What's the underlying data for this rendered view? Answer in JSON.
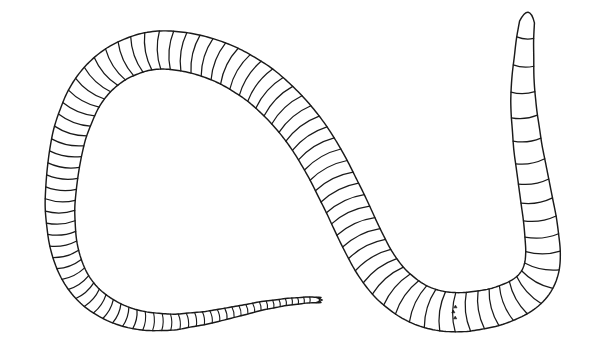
{
  "figure": {
    "title": "Segmented worm line drawing",
    "caption": "",
    "background_color": "#ffffff",
    "line_color": "#1a1a1a",
    "fill_color": "#ffffff",
    "canvas": {
      "width": 593,
      "height": 364
    }
  },
  "chart_data": {
    "type": "diagram",
    "title": "Segmented worm line drawing",
    "parts": [
      {
        "name": "head",
        "label": "anterior tip",
        "position": "upper-right",
        "x": 521,
        "y": 16,
        "width_px": 16,
        "note": "narrow rounded prostomium"
      },
      {
        "name": "clitellum-setae",
        "label": "setae marks",
        "position": "right",
        "x": 538,
        "y": 240,
        "count": 3,
        "note": "three small dark marks inside one segment"
      },
      {
        "name": "tail",
        "label": "posterior tip",
        "position": "lower-centre",
        "x": 322,
        "y": 300,
        "width_px": 5,
        "note": "notched forked terminus"
      }
    ],
    "segment_count_body": 96,
    "segment_count_tail": 34,
    "body_width_min_px": 14,
    "body_width_max_px": 34,
    "xlim": [
      0,
      593
    ],
    "ylim": [
      0,
      364
    ],
    "grid": false,
    "legend": null
  },
  "geometry": {
    "centerline": [
      [
        527,
        22
      ],
      [
        525,
        40
      ],
      [
        524,
        58
      ],
      [
        523,
        76
      ],
      [
        523,
        94
      ],
      [
        524,
        112
      ],
      [
        526,
        130
      ],
      [
        528,
        148
      ],
      [
        531,
        166
      ],
      [
        534,
        184
      ],
      [
        537,
        202
      ],
      [
        540,
        220
      ],
      [
        542,
        238
      ],
      [
        543,
        252
      ],
      [
        542,
        266
      ],
      [
        538,
        278
      ],
      [
        531,
        288
      ],
      [
        521,
        296
      ],
      [
        509,
        302
      ],
      [
        495,
        307
      ],
      [
        480,
        310
      ],
      [
        465,
        312
      ],
      [
        450,
        312
      ],
      [
        436,
        310
      ],
      [
        423,
        306
      ],
      [
        411,
        300
      ],
      [
        400,
        292
      ],
      [
        390,
        283
      ],
      [
        381,
        272
      ],
      [
        373,
        260
      ],
      [
        366,
        247
      ],
      [
        359,
        233
      ],
      [
        352,
        218
      ],
      [
        345,
        203
      ],
      [
        337,
        187
      ],
      [
        329,
        171
      ],
      [
        320,
        155
      ],
      [
        310,
        139
      ],
      [
        299,
        124
      ],
      [
        287,
        110
      ],
      [
        274,
        97
      ],
      [
        260,
        85
      ],
      [
        245,
        75
      ],
      [
        229,
        66
      ],
      [
        212,
        59
      ],
      [
        195,
        54
      ],
      [
        178,
        51
      ],
      [
        161,
        50
      ],
      [
        145,
        52
      ],
      [
        130,
        57
      ],
      [
        116,
        64
      ],
      [
        103,
        74
      ],
      [
        92,
        86
      ],
      [
        83,
        100
      ],
      [
        76,
        116
      ],
      [
        70,
        133
      ],
      [
        66,
        151
      ],
      [
        63,
        170
      ],
      [
        61,
        189
      ],
      [
        60,
        207
      ],
      [
        61,
        225
      ],
      [
        63,
        242
      ],
      [
        67,
        258
      ],
      [
        73,
        273
      ],
      [
        81,
        286
      ],
      [
        91,
        297
      ],
      [
        103,
        306
      ],
      [
        116,
        313
      ],
      [
        130,
        318
      ],
      [
        145,
        321
      ],
      [
        160,
        322
      ],
      [
        175,
        322
      ],
      [
        190,
        320
      ],
      [
        205,
        318
      ],
      [
        220,
        315
      ],
      [
        234,
        312
      ],
      [
        248,
        309
      ],
      [
        261,
        306
      ],
      [
        274,
        304
      ],
      [
        286,
        302
      ],
      [
        297,
        301
      ],
      [
        307,
        300
      ],
      [
        315,
        300
      ],
      [
        321,
        300
      ]
    ],
    "width_profile": [
      [
        0.0,
        7.5
      ],
      [
        0.03,
        10.0
      ],
      [
        0.06,
        12.5
      ],
      [
        0.1,
        14.5
      ],
      [
        0.15,
        16.5
      ],
      [
        0.2,
        18.0
      ],
      [
        0.26,
        19.5
      ],
      [
        0.32,
        20.5
      ],
      [
        0.38,
        21.0
      ],
      [
        0.44,
        21.0
      ],
      [
        0.5,
        20.5
      ],
      [
        0.56,
        19.5
      ],
      [
        0.62,
        18.5
      ],
      [
        0.68,
        17.0
      ],
      [
        0.74,
        15.0
      ],
      [
        0.79,
        13.0
      ],
      [
        0.83,
        11.0
      ],
      [
        0.87,
        9.0
      ],
      [
        0.9,
        7.0
      ],
      [
        0.93,
        5.5
      ],
      [
        0.95,
        4.5
      ],
      [
        0.97,
        3.6
      ],
      [
        0.99,
        3.0
      ],
      [
        1.0,
        2.6
      ]
    ],
    "segment_density": [
      [
        0.0,
        0.022
      ],
      [
        0.2,
        0.01
      ],
      [
        0.5,
        0.0092
      ],
      [
        0.72,
        0.0088
      ],
      [
        0.85,
        0.0072
      ],
      [
        0.93,
        0.0055
      ],
      [
        1.0,
        0.0042
      ]
    ],
    "setae": {
      "t": 0.268,
      "marks": [
        {
          "dx": -5.5,
          "dy": -0.5,
          "r": 1.6
        },
        {
          "dx": 0.5,
          "dy": 1.5,
          "r": 1.6
        },
        {
          "dx": 5.5,
          "dy": -0.5,
          "r": 1.6
        }
      ]
    }
  }
}
